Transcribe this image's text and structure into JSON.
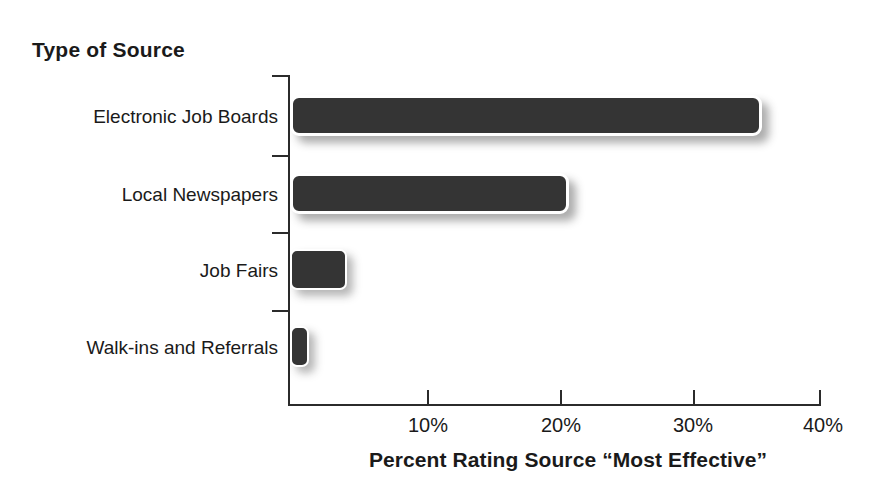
{
  "chart_data": {
    "type": "bar",
    "orientation": "horizontal",
    "title": "",
    "xlabel": "Percent Rating Source “Most Effective”",
    "ylabel": "Type of Source",
    "categories": [
      "Electronic Job Boards",
      "Local Newspapers",
      "Job Fairs",
      "Walk-ins and Referrals"
    ],
    "values": [
      35.5,
      21.0,
      4.3,
      1.4
    ],
    "xlim": [
      0,
      40
    ],
    "xticks": [
      0,
      10,
      20,
      30,
      40
    ],
    "xtick_labels": [
      "",
      "10%",
      "20%",
      "30%",
      "40%"
    ],
    "grid": false,
    "legend": false,
    "bar_color": "#343434",
    "axis_color": "#2b2b2b",
    "background_color": "#ffffff"
  },
  "axes": {
    "y_title": "Type of Source",
    "x_title": "Percent Rating Source “Most Effective”",
    "x_labels": [
      {
        "text": "10%",
        "value": 10
      },
      {
        "text": "20%",
        "value": 20
      },
      {
        "text": "30%",
        "value": 30
      },
      {
        "text": "40%",
        "value": 40
      }
    ]
  },
  "bars": [
    {
      "label": "Electronic Job Boards",
      "value": 35.5
    },
    {
      "label": "Local Newspapers",
      "value": 21.0
    },
    {
      "label": "Job Fairs",
      "value": 4.3
    },
    {
      "label": "Walk-ins and Referrals",
      "value": 1.4
    }
  ]
}
